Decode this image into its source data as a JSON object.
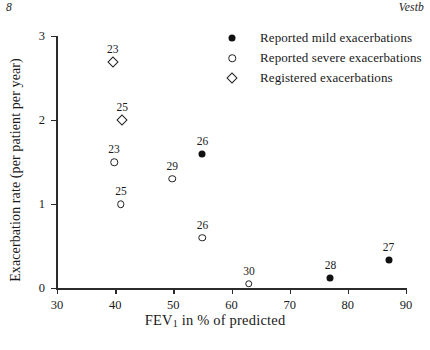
{
  "page": {
    "folio": "8",
    "running_head": "Vestb"
  },
  "chart_data": {
    "type": "scatter",
    "title": "",
    "xlabel": "FEV1 in % of predicted",
    "xlabel_main": "FEV",
    "xlabel_sub": "1",
    "xlabel_rest": " in % of predicted",
    "ylabel": "Exacerbation rate (per patient per year)",
    "xlim": [
      30,
      90
    ],
    "ylim": [
      0,
      3
    ],
    "xticks": [
      30,
      40,
      50,
      60,
      70,
      80,
      90
    ],
    "yticks": [
      0,
      1,
      2,
      3
    ],
    "grid": false,
    "legend_position": "top-right",
    "series": [
      {
        "name": "Reported mild exacerbations",
        "marker": "filled-circle",
        "points": [
          {
            "x": 55,
            "y": 1.6,
            "label": "26"
          },
          {
            "x": 77,
            "y": 0.12,
            "label": "28"
          },
          {
            "x": 87,
            "y": 0.33,
            "label": "27"
          }
        ]
      },
      {
        "name": "Reported severe exacerbations",
        "marker": "open-circle",
        "points": [
          {
            "x": 39.8,
            "y": 1.5,
            "label": "23"
          },
          {
            "x": 41.0,
            "y": 1.0,
            "label": "25"
          },
          {
            "x": 49.8,
            "y": 1.3,
            "label": "29"
          },
          {
            "x": 55.0,
            "y": 0.6,
            "label": "26"
          },
          {
            "x": 63.0,
            "y": 0.05,
            "label": "30"
          }
        ]
      },
      {
        "name": "Registered exacerbations",
        "marker": "open-diamond",
        "points": [
          {
            "x": 39.6,
            "y": 2.69,
            "label": "23"
          },
          {
            "x": 41.2,
            "y": 2.0,
            "label": "25"
          }
        ]
      }
    ],
    "legend": [
      {
        "key": "filled-circle",
        "label": "Reported mild exacerbations"
      },
      {
        "key": "open-circle",
        "label": "Reported severe exacerbations"
      },
      {
        "key": "open-diamond",
        "label": "Registered exacerbations"
      }
    ],
    "colors": {
      "marker": "#111111",
      "axis": "#2b2b2b",
      "text": "#1a1a1a",
      "background": "#ffffff"
    }
  }
}
